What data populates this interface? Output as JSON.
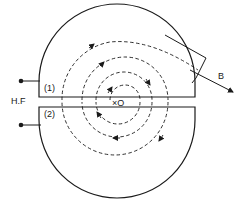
{
  "diagram": {
    "type": "cyclotron",
    "labels": {
      "dee_upper": "(1)",
      "dee_lower": "(2)",
      "hf_source": "H.F",
      "center": "×O",
      "beam": "B"
    },
    "colors": {
      "stroke": "#1a1a1a",
      "background": "#ffffff"
    }
  }
}
